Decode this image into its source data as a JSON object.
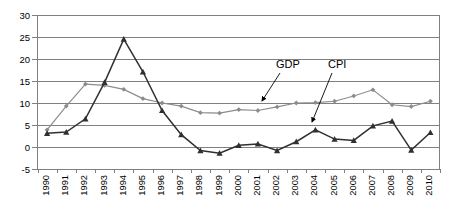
{
  "chart_data": {
    "type": "line",
    "title": "",
    "xlabel": "",
    "ylabel": "",
    "ylim": [
      -5,
      30
    ],
    "yticks": [
      -5,
      0,
      5,
      10,
      15,
      20,
      25,
      30
    ],
    "grid": true,
    "legend": "annotations",
    "categories": [
      "1990",
      "1991",
      "1992",
      "1993",
      "1994",
      "1995",
      "1996",
      "1997",
      "1998",
      "1999",
      "2000",
      "2001",
      "2002",
      "2003",
      "2004",
      "2005",
      "2006",
      "2007",
      "2008",
      "2009",
      "2010"
    ],
    "series": [
      {
        "name": "GDP",
        "color": "#8c8c8c",
        "marker": "diamond",
        "values": [
          3.9,
          9.3,
          14.3,
          14.0,
          13.1,
          11.0,
          10.0,
          9.3,
          7.8,
          7.7,
          8.5,
          8.3,
          9.1,
          10.0,
          10.1,
          10.4,
          11.6,
          13.0,
          9.6,
          9.2,
          10.4
        ]
      },
      {
        "name": "CPI",
        "color": "#303030",
        "marker": "triangle",
        "values": [
          3.1,
          3.4,
          6.4,
          14.7,
          24.5,
          17.1,
          8.3,
          2.8,
          -0.8,
          -1.4,
          0.4,
          0.7,
          -0.8,
          1.2,
          3.9,
          1.8,
          1.5,
          4.8,
          5.9,
          -0.7,
          3.3
        ]
      }
    ],
    "annotations": [
      {
        "text": "GDP",
        "label_x": 276,
        "label_y": 59,
        "arrow_to_x": 262,
        "arrow_to_y": 101
      },
      {
        "text": "CPI",
        "label_x": 328,
        "label_y": 59,
        "arrow_to_x": 312,
        "arrow_to_y": 122
      }
    ]
  },
  "axes": {
    "y_tick_labels": [
      "30",
      "25",
      "20",
      "15",
      "10",
      "5",
      "0",
      "-5"
    ],
    "x_tick_labels": [
      "1990",
      "1991",
      "1992",
      "1993",
      "1994",
      "1995",
      "1996",
      "1997",
      "1998",
      "1999",
      "2000",
      "2001",
      "2002",
      "2003",
      "2004",
      "2005",
      "2006",
      "2007",
      "2008",
      "2009",
      "2010"
    ]
  },
  "colors": {
    "gdp": "#8c8c8c",
    "cpi": "#303030",
    "grid": "#808080",
    "background": "#ffffff"
  }
}
